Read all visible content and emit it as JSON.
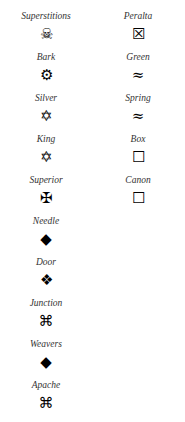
{
  "left_column": [
    {
      "label": "Superstitions",
      "icon": "skull-crossbones-icon",
      "glyph": "☠"
    },
    {
      "label": "Bark",
      "icon": "gear-outline-icon",
      "glyph": "⚙"
    },
    {
      "label": "Silver",
      "icon": "star-of-david-icon",
      "glyph": "✡"
    },
    {
      "label": "King",
      "icon": "star-of-david-icon",
      "glyph": "✡"
    },
    {
      "label": "Superior",
      "icon": "maltese-cross-icon",
      "glyph": "✠"
    },
    {
      "label": "Needle",
      "icon": "black-diamond-icon",
      "glyph": "◆"
    },
    {
      "label": "Door",
      "icon": "four-diamonds-icon",
      "glyph": "❖"
    },
    {
      "label": "Junction",
      "icon": "command-key-icon",
      "glyph": "⌘"
    },
    {
      "label": "Weavers",
      "icon": "black-diamond-icon",
      "glyph": "◆"
    },
    {
      "label": "Apache",
      "icon": "command-key-icon",
      "glyph": "⌘"
    }
  ],
  "right_column": [
    {
      "label": "Peralta",
      "icon": "x-in-box-icon",
      "glyph": "☒"
    },
    {
      "label": "Green",
      "icon": "water-waves-icon",
      "glyph": "≈"
    },
    {
      "label": "Spring",
      "icon": "water-waves-icon",
      "glyph": "≈"
    },
    {
      "label": "Box",
      "icon": "square-outline-icon",
      "glyph": "☐"
    },
    {
      "label": "Canon",
      "icon": "square-outline-icon",
      "glyph": "☐"
    }
  ]
}
